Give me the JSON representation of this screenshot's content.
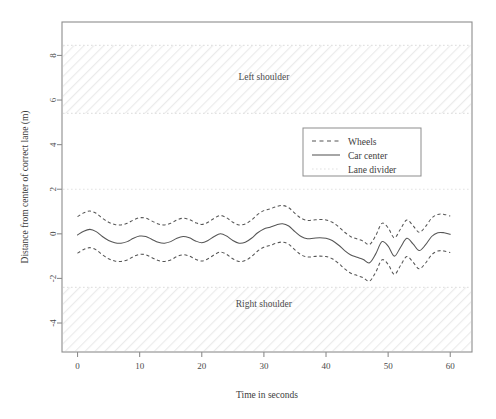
{
  "chart_data": {
    "type": "line",
    "title": "",
    "xlabel": "Time in seconds",
    "ylabel": "Distance from center of correct lane (m)",
    "xlim": [
      -2.5,
      63.5
    ],
    "ylim": [
      -5.3,
      9.5
    ],
    "xticks": [
      0,
      10,
      20,
      30,
      40,
      50,
      60
    ],
    "xticklabels": [
      "0",
      "10",
      "20",
      "30",
      "40",
      "50",
      "60"
    ],
    "yticks": [
      8,
      6,
      4,
      2,
      0,
      -2,
      -4
    ],
    "yticklabels": [
      "8",
      "6",
      "4",
      "2",
      "0",
      "-2",
      "-4"
    ],
    "grid": false,
    "legend_position": "upper right",
    "legend": [
      {
        "label": "Wheels",
        "style": "dashed",
        "color": "#555555"
      },
      {
        "label": "Car center",
        "style": "solid",
        "color": "#555555"
      },
      {
        "label": "Lane divider",
        "style": "dotted",
        "color": "#e2e2e2"
      }
    ],
    "annotations": [
      {
        "text": "Left shoulder",
        "x": 30,
        "y": 6.9
      },
      {
        "text": "Right shoulder",
        "x": 30,
        "y": -3.3
      }
    ],
    "shaded_regions": [
      {
        "name": "left-shoulder-band",
        "y0": 5.4,
        "y1": 8.45,
        "hatch": "///",
        "color": "#f2f2f2"
      },
      {
        "name": "right-shoulder-band",
        "y0": -5.3,
        "y1": -2.4,
        "hatch": "///",
        "color": "#f2f2f2"
      }
    ],
    "divider_lines": [
      2.0,
      -2.4,
      5.4,
      8.45
    ],
    "wheel_offset": 0.82,
    "series": [
      {
        "name": "Car center",
        "style": "solid",
        "x": [
          0,
          1,
          2,
          3,
          4,
          5,
          6,
          7,
          8,
          9,
          10,
          11,
          12,
          13,
          14,
          15,
          16,
          17,
          18,
          19,
          20,
          21,
          22,
          23,
          24,
          25,
          26,
          27,
          28,
          29,
          30,
          31,
          32,
          33,
          34,
          35,
          36,
          37,
          38,
          39,
          40,
          41,
          42,
          43,
          44,
          45,
          46,
          47,
          48,
          49,
          50,
          51,
          52,
          53,
          54,
          55,
          56,
          57,
          58,
          59,
          60
        ],
        "values": [
          -0.05,
          0.12,
          0.2,
          0.1,
          -0.12,
          -0.3,
          -0.4,
          -0.42,
          -0.35,
          -0.2,
          -0.1,
          -0.12,
          -0.25,
          -0.38,
          -0.42,
          -0.35,
          -0.2,
          -0.12,
          -0.18,
          -0.32,
          -0.4,
          -0.3,
          -0.12,
          0.0,
          -0.1,
          -0.3,
          -0.42,
          -0.38,
          -0.2,
          0.05,
          0.22,
          0.3,
          0.4,
          0.45,
          0.35,
          0.1,
          -0.12,
          -0.22,
          -0.2,
          -0.18,
          -0.2,
          -0.3,
          -0.5,
          -0.75,
          -0.95,
          -1.05,
          -1.15,
          -1.3,
          -0.9,
          -0.35,
          -0.55,
          -1.0,
          -0.6,
          -0.2,
          -0.45,
          -0.75,
          -0.5,
          -0.12,
          0.05,
          0.05,
          -0.02
        ]
      },
      {
        "name": "Wheels upper",
        "style": "dashed",
        "x": [
          0,
          1,
          2,
          3,
          4,
          5,
          6,
          7,
          8,
          9,
          10,
          11,
          12,
          13,
          14,
          15,
          16,
          17,
          18,
          19,
          20,
          21,
          22,
          23,
          24,
          25,
          26,
          27,
          28,
          29,
          30,
          31,
          32,
          33,
          34,
          35,
          36,
          37,
          38,
          39,
          40,
          41,
          42,
          43,
          44,
          45,
          46,
          47,
          48,
          49,
          50,
          51,
          52,
          53,
          54,
          55,
          56,
          57,
          58,
          59,
          60
        ],
        "values": [
          0.77,
          0.94,
          1.02,
          0.92,
          0.7,
          0.52,
          0.42,
          0.4,
          0.47,
          0.62,
          0.72,
          0.7,
          0.57,
          0.44,
          0.4,
          0.47,
          0.62,
          0.7,
          0.64,
          0.5,
          0.42,
          0.52,
          0.7,
          0.82,
          0.72,
          0.52,
          0.4,
          0.44,
          0.62,
          0.87,
          1.04,
          1.12,
          1.22,
          1.27,
          1.17,
          0.92,
          0.7,
          0.6,
          0.62,
          0.64,
          0.62,
          0.52,
          0.32,
          0.07,
          -0.13,
          -0.23,
          -0.33,
          -0.48,
          -0.08,
          0.47,
          0.27,
          -0.18,
          0.22,
          0.62,
          0.37,
          0.07,
          0.32,
          0.7,
          0.87,
          0.87,
          0.8
        ]
      },
      {
        "name": "Wheels lower",
        "style": "dashed",
        "x": [
          0,
          1,
          2,
          3,
          4,
          5,
          6,
          7,
          8,
          9,
          10,
          11,
          12,
          13,
          14,
          15,
          16,
          17,
          18,
          19,
          20,
          21,
          22,
          23,
          24,
          25,
          26,
          27,
          28,
          29,
          30,
          31,
          32,
          33,
          34,
          35,
          36,
          37,
          38,
          39,
          40,
          41,
          42,
          43,
          44,
          45,
          46,
          47,
          48,
          49,
          50,
          51,
          52,
          53,
          54,
          55,
          56,
          57,
          58,
          59,
          60
        ],
        "values": [
          -0.87,
          -0.7,
          -0.62,
          -0.72,
          -0.94,
          -1.12,
          -1.22,
          -1.24,
          -1.17,
          -1.02,
          -0.92,
          -0.94,
          -1.07,
          -1.2,
          -1.24,
          -1.17,
          -1.02,
          -0.94,
          -1.0,
          -1.14,
          -1.22,
          -1.12,
          -0.94,
          -0.82,
          -0.92,
          -1.12,
          -1.24,
          -1.2,
          -1.02,
          -0.77,
          -0.6,
          -0.52,
          -0.42,
          -0.37,
          -0.47,
          -0.72,
          -0.94,
          -1.04,
          -1.02,
          -1.0,
          -1.02,
          -1.12,
          -1.32,
          -1.57,
          -1.77,
          -1.87,
          -1.97,
          -2.12,
          -1.72,
          -1.17,
          -1.37,
          -1.82,
          -1.42,
          -1.02,
          -1.27,
          -1.57,
          -1.32,
          -0.94,
          -0.77,
          -0.77,
          -0.84
        ]
      }
    ]
  }
}
